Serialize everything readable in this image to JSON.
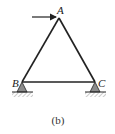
{
  "diagram": {
    "type": "truss",
    "nodes": [
      {
        "id": "A",
        "label": "A",
        "x": 59,
        "y": 18
      },
      {
        "id": "B",
        "label": "B",
        "x": 22,
        "y": 82
      },
      {
        "id": "C",
        "label": "C",
        "x": 95,
        "y": 82
      }
    ],
    "members": [
      [
        "A",
        "B"
      ],
      [
        "A",
        "C"
      ],
      [
        "B",
        "C"
      ]
    ],
    "load": {
      "at": "A",
      "direction": "right",
      "label": ""
    },
    "supports": [
      {
        "at": "B",
        "type": "pin"
      },
      {
        "at": "C",
        "type": "pin"
      }
    ],
    "caption": "(b)",
    "colors": {
      "line": "#222222",
      "support_fill": "#8c8c8c",
      "ground_hatch": "#9a9a9a"
    }
  }
}
